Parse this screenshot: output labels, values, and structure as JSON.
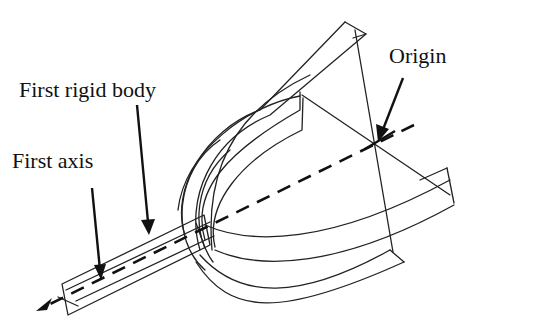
{
  "figure": {
    "type": "mechanical line drawing",
    "labels": {
      "first_rigid_body": "First rigid body",
      "first_axis": "First axis",
      "origin": "Origin"
    },
    "colors": {
      "line": "#222222",
      "text": "#111111",
      "background": "#ffffff"
    }
  }
}
